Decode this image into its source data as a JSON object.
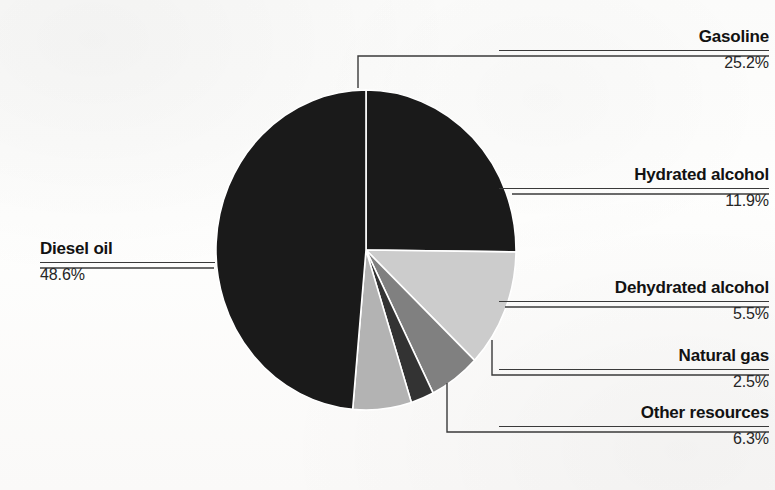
{
  "chart_data": {
    "type": "pie",
    "title": "",
    "subtitle": "",
    "xlabel": "",
    "ylabel": "",
    "legend_position": "callout-labels",
    "units": "percent",
    "total": 100.0,
    "categories": [
      "Gasoline",
      "Hydrated alcohol",
      "Dehydrated alcohol",
      "Natural gas",
      "Other resources",
      "Diesel oil"
    ],
    "values": [
      25.2,
      11.9,
      5.5,
      2.5,
      6.3,
      48.6
    ],
    "value_labels": [
      "25.2%",
      "11.9%",
      "5.5%",
      "2.5%",
      "6.3%",
      "48.6%"
    ],
    "slice_colors": [
      "#1a1a1a",
      "#cccccc",
      "#808080",
      "#333333",
      "#b3b3b3",
      "#1a1a1a"
    ],
    "start_angle_deg": 0,
    "direction": "clockwise",
    "slices": [
      {
        "name": "Gasoline",
        "value": 25.2,
        "value_label": "25.2%",
        "color": "#1a1a1a",
        "start_deg": 0.0,
        "end_deg": 90.7
      },
      {
        "name": "Hydrated alcohol",
        "value": 11.9,
        "value_label": "11.9%",
        "color": "#cccccc",
        "start_deg": 90.7,
        "end_deg": 133.6
      },
      {
        "name": "Dehydrated alcohol",
        "value": 5.5,
        "value_label": "5.5%",
        "color": "#808080",
        "start_deg": 133.6,
        "end_deg": 153.4
      },
      {
        "name": "Natural gas",
        "value": 2.5,
        "value_label": "2.5%",
        "color": "#333333",
        "start_deg": 153.4,
        "end_deg": 162.4
      },
      {
        "name": "Other resources",
        "value": 6.3,
        "value_label": "6.3%",
        "color": "#b3b3b3",
        "start_deg": 162.4,
        "end_deg": 185.1
      },
      {
        "name": "Diesel oil",
        "value": 48.6,
        "value_label": "48.6%",
        "color": "#1a1a1a",
        "start_deg": 185.1,
        "end_deg": 360.0
      }
    ]
  },
  "labels": {
    "gasoline": {
      "name": "Gasoline",
      "value": "25.2%"
    },
    "hydrated_alcohol": {
      "name": "Hydrated alcohol",
      "value": "11.9%"
    },
    "dehydrated_alcohol": {
      "name": "Dehydrated alcohol",
      "value": "5.5%"
    },
    "natural_gas": {
      "name": "Natural gas",
      "value": "2.5%"
    },
    "other_resources": {
      "name": "Other resources",
      "value": "6.3%"
    },
    "diesel_oil": {
      "name": "Diesel oil",
      "value": "48.6%"
    }
  },
  "colors": {
    "leader_line": "#3a3a3a",
    "slice_separator": "#ffffff",
    "text_primary": "#121212",
    "text_secondary": "#262626",
    "background": "#fdfdfc"
  }
}
